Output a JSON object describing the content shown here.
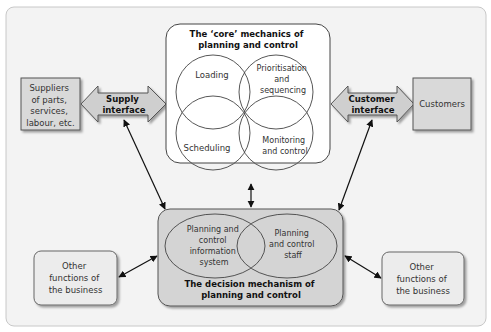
{
  "diagram": {
    "suppliers": {
      "lines": [
        "Suppliers",
        "of parts,",
        "services,",
        "labour, etc."
      ]
    },
    "supply_interface": {
      "lines": [
        "Supply",
        "interface"
      ]
    },
    "core": {
      "title_lines": [
        "The ‘core’ mechanics of",
        "planning and control"
      ],
      "circles": {
        "loading": {
          "lines": [
            "Loading"
          ]
        },
        "prioritisation": {
          "lines": [
            "Prioritisation",
            "and",
            "sequencing"
          ]
        },
        "scheduling": {
          "lines": [
            "Scheduling"
          ]
        },
        "monitoring": {
          "lines": [
            "Monitoring",
            "and control"
          ]
        }
      }
    },
    "customer_interface": {
      "lines": [
        "Customer",
        "interface"
      ]
    },
    "customers": {
      "lines": [
        "Customers"
      ]
    },
    "decision": {
      "title_lines": [
        "The decision mechanism of",
        "planning and control"
      ],
      "ellipses": {
        "info_system": {
          "lines": [
            "Planning and",
            "control",
            "information",
            "system"
          ]
        },
        "staff": {
          "lines": [
            "Planning",
            "and control",
            "staff"
          ]
        }
      }
    },
    "other_left": {
      "lines": [
        "Other",
        "functions of",
        "the business"
      ]
    },
    "other_right": {
      "lines": [
        "Other",
        "functions of",
        "the business"
      ]
    }
  },
  "colors": {
    "frame_bg": "#f3f3f3",
    "box_fill": "#d9d9d9",
    "decision_fill": "#d4d4d4",
    "light_box": "#ececec",
    "stroke": "#555555"
  }
}
